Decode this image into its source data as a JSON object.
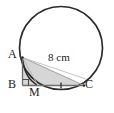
{
  "figure": {
    "type": "circle-geometry-diagram",
    "colors": {
      "stroke": "#2b2b2b",
      "faint_stroke": "#9a9a9a",
      "shade_fill": "#d4d4d4",
      "background": "#ffffff",
      "text": "#1c1c1c"
    },
    "circle": {
      "name": "main-circle",
      "cx": 61,
      "cy": 48,
      "r": 41.5
    },
    "points": [
      {
        "id": "A",
        "label": "A",
        "x": 22.5,
        "y": 57.5
      },
      {
        "id": "B",
        "label": "B",
        "x": 22.5,
        "y": 85.5
      },
      {
        "id": "M",
        "label": "M",
        "x": 38.0,
        "y": 85.5
      },
      {
        "id": "C",
        "label": "C",
        "x": 84.0,
        "y": 85.5
      }
    ],
    "segments": [
      {
        "id": "AB",
        "from": "A",
        "to": "B",
        "style": "solid"
      },
      {
        "id": "BC",
        "from": "B",
        "to": "C",
        "style": "solid"
      },
      {
        "id": "AC",
        "from": "A",
        "to": "C",
        "style": "faint"
      },
      {
        "id": "AM",
        "from": "A",
        "to": "M",
        "style": "faint"
      }
    ],
    "shaded_region": {
      "name": "triangle-ABC-shading",
      "vertices": [
        "A",
        "B",
        "C"
      ]
    },
    "markers": {
      "right_angle": {
        "at": "B",
        "size": 6
      },
      "tick": {
        "on_segment": "MC",
        "x": 61,
        "y": 85.5
      }
    },
    "labels": {
      "A": "A",
      "B": "B",
      "M": "M",
      "C": "C",
      "measurement": "8 cm"
    }
  }
}
